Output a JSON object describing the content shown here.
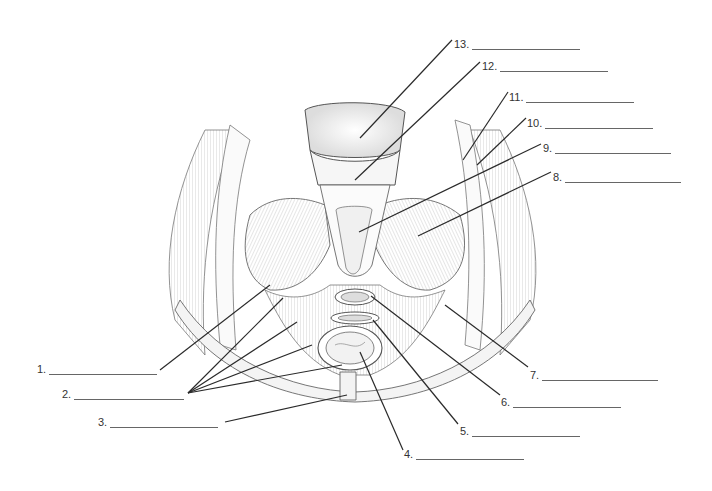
{
  "diagram": {
    "labels": [
      {
        "num": "1.",
        "x": 37,
        "y": 363,
        "blank_width": 108,
        "target": [
          270,
          285
        ],
        "anchor": [
          160,
          370
        ]
      },
      {
        "num": "2.",
        "x": 62,
        "y": 388,
        "blank_width": 110,
        "targets": [
          [
            283,
            298
          ],
          [
            297,
            322
          ],
          [
            312,
            345
          ],
          [
            342,
            365
          ]
        ],
        "anchor": [
          188,
          393
        ]
      },
      {
        "num": "3.",
        "x": 98,
        "y": 416,
        "blank_width": 108,
        "target": [
          347,
          395
        ],
        "anchor": [
          225,
          422
        ]
      },
      {
        "num": "4.",
        "x": 404,
        "y": 448,
        "blank_width": 108,
        "target": [
          360,
          352
        ],
        "anchor": [
          403,
          450
        ]
      },
      {
        "num": "5.",
        "x": 460,
        "y": 425,
        "blank_width": 108,
        "target": [
          373,
          320
        ],
        "anchor": [
          458,
          424
        ]
      },
      {
        "num": "6.",
        "x": 501,
        "y": 396,
        "blank_width": 108,
        "target": [
          371,
          296
        ],
        "anchor": [
          500,
          395
        ]
      },
      {
        "num": "7.",
        "x": 530,
        "y": 369,
        "blank_width": 116,
        "target": [
          445,
          305
        ],
        "anchor": [
          528,
          367
        ]
      },
      {
        "num": "8.",
        "x": 553,
        "y": 171,
        "blank_width": 116,
        "target": [
          418,
          236
        ],
        "anchor": [
          551,
          172
        ]
      },
      {
        "num": "9.",
        "x": 543,
        "y": 142,
        "blank_width": 116,
        "target": [
          359,
          232
        ],
        "anchor": [
          541,
          144
        ]
      },
      {
        "num": "10.",
        "x": 527,
        "y": 117,
        "blank_width": 108,
        "target": [
          477,
          165
        ],
        "anchor": [
          526,
          118
        ]
      },
      {
        "num": "11.",
        "x": 509,
        "y": 91,
        "blank_width": 108,
        "target": [
          463,
          160
        ],
        "anchor": [
          508,
          92
        ]
      },
      {
        "num": "12.",
        "x": 482,
        "y": 60,
        "blank_width": 108,
        "target": [
          355,
          180
        ],
        "anchor": [
          480,
          62
        ]
      },
      {
        "num": "13.",
        "x": 454,
        "y": 38,
        "blank_width": 108,
        "target": [
          360,
          138
        ],
        "anchor": [
          452,
          40
        ]
      }
    ],
    "colors": {
      "background": "#ffffff",
      "leader_line": "#2a2a2a",
      "blank_line": "#666666",
      "label_text": "#333333",
      "illustration_stroke": "#555555",
      "muscle_hatch": "#9a9a9a"
    }
  }
}
